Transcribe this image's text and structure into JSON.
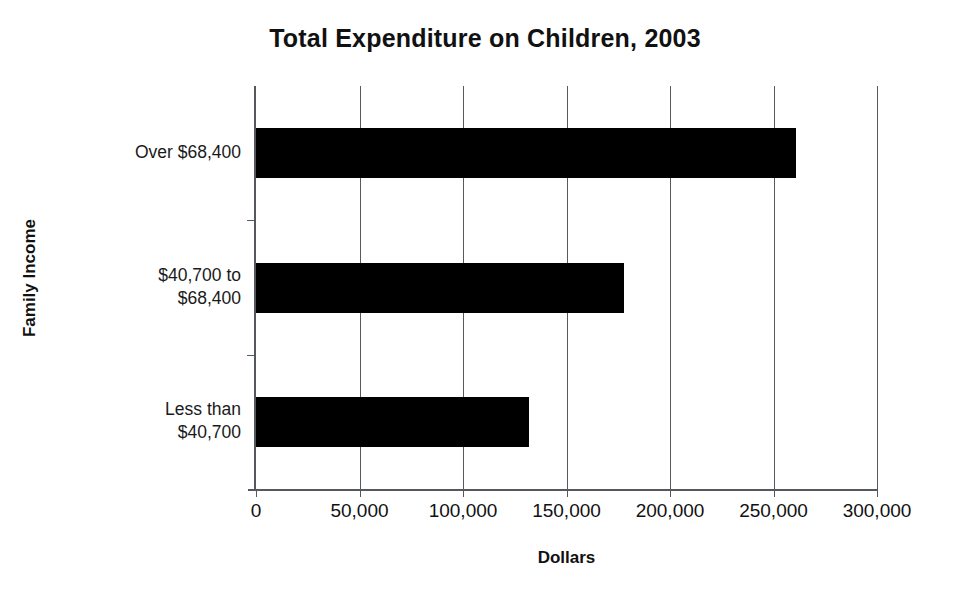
{
  "chart_data": {
    "type": "bar",
    "orientation": "horizontal",
    "title": "Total Expenditure on Children, 2003",
    "xlabel": "Dollars",
    "ylabel": "Family Income",
    "categories": [
      "Less than\n$40,700",
      "$40,700 to\n$68,400",
      "Over $68,400"
    ],
    "values": [
      131800,
      177900,
      260900
    ],
    "xlim": [
      0,
      300000
    ],
    "xticks": [
      0,
      50000,
      100000,
      150000,
      200000,
      250000,
      300000
    ],
    "xticklabels": [
      "0",
      "50,000",
      "100,000",
      "150,000",
      "200,000",
      "250,000",
      "300,000"
    ],
    "grid": "vertical",
    "legend": "none",
    "bar_color": "#000000",
    "axis_color": "#55595d",
    "series": [
      {
        "name": "Total expenditure",
        "values": [
          131800,
          177900,
          260900
        ]
      }
    ]
  }
}
